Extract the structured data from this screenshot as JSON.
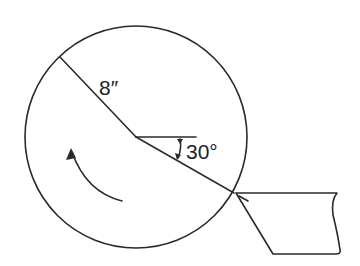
{
  "diagram": {
    "type": "geometry",
    "labels": {
      "radius": "8″",
      "angle": "30°"
    },
    "colors": {
      "line": "#2a2a2a",
      "background": "#ffffff"
    }
  }
}
